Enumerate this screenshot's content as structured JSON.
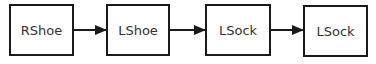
{
  "diagram": {
    "type": "flow",
    "direction": "left-to-right",
    "nodes": [
      {
        "id": "n1",
        "label": "RShoe"
      },
      {
        "id": "n2",
        "label": "LShoe"
      },
      {
        "id": "n3",
        "label": "LSock"
      },
      {
        "id": "n4",
        "label": "LSock"
      }
    ],
    "edges": [
      {
        "from": "n1",
        "to": "n2"
      },
      {
        "from": "n2",
        "to": "n3"
      },
      {
        "from": "n3",
        "to": "n4"
      }
    ],
    "colors": {
      "stroke": "#1a1a1a",
      "fill": "#ffffff",
      "text": "#333333"
    }
  }
}
